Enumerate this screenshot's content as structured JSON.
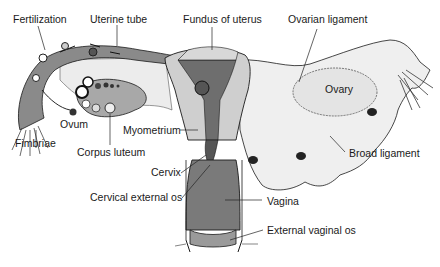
{
  "figure": {
    "labels": {
      "fertilization": "Fertilization",
      "uterine_tube": "Uterine tube",
      "fundus": "Fundus of uterus",
      "ovarian_ligament": "Ovarian ligament",
      "ovary": "Ovary",
      "ovum": "Ovum",
      "fimbriae": "Fimbriae",
      "corpus_luteum": "Corpus luteum",
      "myometrium": "Myometrium",
      "broad_ligament": "Broad ligament",
      "cervix": "Cervix",
      "cervical_external_os": "Cervical external os",
      "vagina": "Vagina",
      "external_vaginal_os": "External vaginal os"
    },
    "colors": {
      "background": "#ffffff",
      "outline": "#1a1a1a",
      "tube_fill": "#8a8a8a",
      "light_tissue": "#e6e6e6",
      "uterine_cavity": "#6e6e6e",
      "myometrium": "#c8c8c8",
      "vagina_fill": "#7a7a7a",
      "broad_ligament": "#efefef"
    }
  }
}
